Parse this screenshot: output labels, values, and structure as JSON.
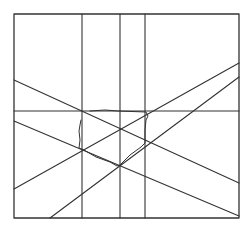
{
  "diagram": {
    "stroke_color": "#333333",
    "background": "#ffffff",
    "frame": {
      "x1": 14,
      "y1": 14,
      "x2": 239,
      "y2": 218
    },
    "lines": [
      {
        "id": "vertical-1",
        "x1": 82,
        "y1": 14,
        "x2": 82,
        "y2": 218
      },
      {
        "id": "vertical-2",
        "x1": 120,
        "y1": 14,
        "x2": 120,
        "y2": 218
      },
      {
        "id": "vertical-3",
        "x1": 145,
        "y1": 14,
        "x2": 145,
        "y2": 218
      },
      {
        "id": "horizontal-1",
        "x1": 14,
        "y1": 111,
        "x2": 239,
        "y2": 111
      },
      {
        "id": "diagonal-a",
        "x1": 14,
        "y1": 80,
        "x2": 239,
        "y2": 183
      },
      {
        "id": "diagonal-b",
        "x1": 14,
        "y1": 121,
        "x2": 239,
        "y2": 216
      },
      {
        "id": "diagonal-c",
        "x1": 14,
        "y1": 189,
        "x2": 239,
        "y2": 63
      },
      {
        "id": "diagonal-d",
        "x1": 50,
        "y1": 218,
        "x2": 239,
        "y2": 77
      }
    ],
    "sketch_polygon": "90,111 105,110 118,111 146,112 148,116 146,120 145,130 145,143 141,147 130,155 122,163 120,165 117,166 110,162 96,157 84,150 79,148 80,140 79,131 80,125 81,120"
  }
}
